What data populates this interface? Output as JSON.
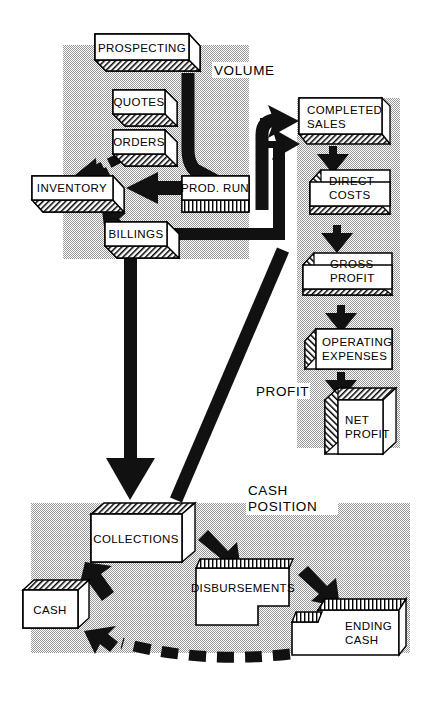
{
  "diagram": {
    "type": "block-flow-diagram",
    "style": "3d-isometric-boxes-halftone-panels",
    "colors": {
      "background": "#ffffff",
      "panel_gray": "#c8c8c8",
      "box_fill": "#ffffff",
      "ink": "#000000",
      "arrow": "#1a1a1a"
    }
  },
  "panels": [
    {
      "id": "volume",
      "label": "VOLUME",
      "label_lines": [
        "VOLUME"
      ]
    },
    {
      "id": "profit",
      "label": "PROFIT",
      "label_lines": [
        "PROFIT"
      ]
    },
    {
      "id": "cash",
      "label": "CASH POSITION",
      "label_lines": [
        "CASH",
        "POSITION"
      ]
    }
  ],
  "boxes": [
    {
      "id": "prospecting",
      "panel": "volume",
      "lines": [
        "PROSPECTING"
      ],
      "shade": "top"
    },
    {
      "id": "quotes",
      "panel": "volume",
      "lines": [
        "QUOTES"
      ],
      "shade": "bottom"
    },
    {
      "id": "orders",
      "panel": "volume",
      "lines": [
        "ORDERS"
      ],
      "shade": "bottom"
    },
    {
      "id": "inventory",
      "panel": "volume",
      "lines": [
        "INVENTORY"
      ],
      "shade": "bottom"
    },
    {
      "id": "prod-run",
      "panel": "volume",
      "lines": [
        "PROD. RUN"
      ],
      "shade": "bottom"
    },
    {
      "id": "billings",
      "panel": "volume",
      "lines": [
        "BILLINGS"
      ],
      "shade": "bottom"
    },
    {
      "id": "completed-sales",
      "panel": "profit",
      "lines": [
        "COMPLETED",
        "SALES"
      ],
      "shade": "bottom"
    },
    {
      "id": "direct-costs",
      "panel": "profit",
      "lines": [
        "DIRECT",
        "COSTS"
      ],
      "shade": "bottom"
    },
    {
      "id": "gross-profit",
      "panel": "profit",
      "lines": [
        "GROSS",
        "PROFIT"
      ],
      "shade": "bottom"
    },
    {
      "id": "operating-expenses",
      "panel": "profit",
      "lines": [
        "OPERATING",
        "EXPENSES"
      ],
      "shade": "left"
    },
    {
      "id": "net-profit",
      "panel": "profit",
      "lines": [
        "NET",
        "PROFIT"
      ],
      "shade": "cube"
    },
    {
      "id": "collections",
      "panel": "cash",
      "lines": [
        "COLLECTIONS"
      ],
      "shade": "top"
    },
    {
      "id": "cash",
      "panel": "cash",
      "lines": [
        "CASH"
      ],
      "shade": "top"
    },
    {
      "id": "disbursements",
      "panel": "cash",
      "lines": [
        "DISBURSEMENTS"
      ],
      "shade": "top"
    },
    {
      "id": "ending-cash",
      "panel": "cash",
      "lines": [
        "ENDING",
        "CASH"
      ],
      "shade": "top"
    }
  ],
  "flows": [
    {
      "from": "prospecting",
      "to": "prod-run",
      "kind": "solid-curved"
    },
    {
      "from": "orders",
      "to": "inventory",
      "kind": "dashed"
    },
    {
      "from": "prod-run",
      "to": "inventory",
      "kind": "solid"
    },
    {
      "from": "inventory",
      "to": "billings",
      "kind": "solid"
    },
    {
      "from": "prospecting",
      "to": "completed-sales",
      "kind": "solid-curved"
    },
    {
      "from": "billings",
      "to": "completed-sales",
      "kind": "solid-elbow"
    },
    {
      "from": "completed-sales",
      "to": "direct-costs",
      "kind": "solid"
    },
    {
      "from": "direct-costs",
      "to": "gross-profit",
      "kind": "solid"
    },
    {
      "from": "gross-profit",
      "to": "operating-expenses",
      "kind": "solid"
    },
    {
      "from": "operating-expenses",
      "to": "net-profit",
      "kind": "solid"
    },
    {
      "from": "billings",
      "to": "collections",
      "kind": "solid-vertical"
    },
    {
      "from": "completed-sales",
      "to": "collections",
      "kind": "solid-diagonal"
    },
    {
      "from": "cash",
      "to": "collections",
      "kind": "solid"
    },
    {
      "from": "collections",
      "to": "disbursements",
      "kind": "solid"
    },
    {
      "from": "disbursements",
      "to": "ending-cash",
      "kind": "solid"
    },
    {
      "from": "ending-cash",
      "to": "cash",
      "kind": "dashed-curved"
    }
  ]
}
